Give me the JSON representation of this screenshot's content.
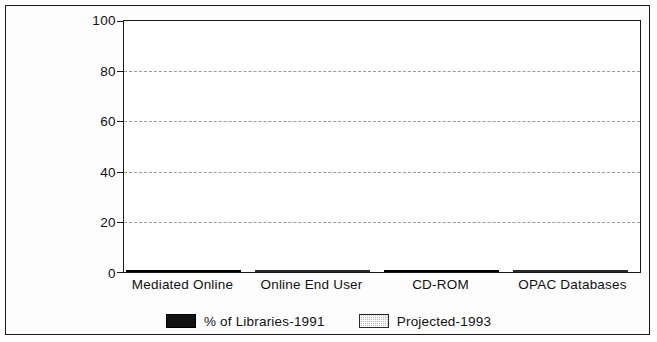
{
  "chart_data": {
    "type": "bar",
    "subtype": "stacked",
    "title": "",
    "xlabel": "",
    "ylabel": "",
    "ylim": [
      0,
      100
    ],
    "yticks": [
      0,
      20,
      40,
      60,
      80,
      100
    ],
    "ytick_labels": [
      "0",
      "20",
      "40",
      "60",
      "80",
      "100"
    ],
    "grid": true,
    "grid_axis": "y",
    "legend_position": "bottom-center",
    "categories": [
      "Mediated Online",
      "Online End User",
      "CD-ROM",
      "OPAC Databases"
    ],
    "series": [
      {
        "name": "% of Libraries-1991",
        "color": "#121212",
        "pattern": "solid",
        "values": [
          98,
          45,
          96,
          38
        ]
      },
      {
        "name": "Projected-1993",
        "color": "#b9b9b9",
        "pattern": "hatched",
        "values": [
          0,
          45,
          0,
          48
        ]
      }
    ],
    "stack_totals": [
      98,
      90,
      96,
      86
    ]
  },
  "legend": {
    "items": [
      {
        "label": "% of Libraries-1991",
        "swatch": "black-swatch-icon"
      },
      {
        "label": "Projected-1993",
        "swatch": "hatched-swatch-icon"
      }
    ]
  }
}
